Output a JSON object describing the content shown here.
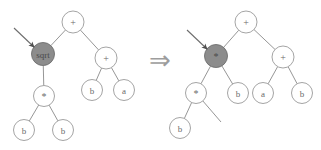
{
  "figure": {
    "implies_symbol": "⇒",
    "colors": {
      "edge": "#8a8a8a",
      "node_stroke": "#9a9a9a",
      "node_fill": "#ffffff",
      "highlight_fill": "#8c8c8c",
      "label": "#6b6b6b",
      "arrow": "#4f4f4f",
      "background": "#ffffff"
    }
  },
  "left_tree": {
    "name": "before-tree",
    "nodes": [
      {
        "id": "L0",
        "label": "+",
        "x": 73,
        "y": 22,
        "r": 11,
        "highlight": false,
        "kind": "operator"
      },
      {
        "id": "L1",
        "label": "sqrt",
        "x": 43,
        "y": 54,
        "r": 11.5,
        "highlight": true,
        "kind": "function"
      },
      {
        "id": "L2",
        "label": "+",
        "x": 106,
        "y": 58,
        "r": 11,
        "highlight": false,
        "kind": "operator"
      },
      {
        "id": "L3",
        "label": "*",
        "x": 44,
        "y": 96,
        "r": 10.5,
        "highlight": false,
        "kind": "operator"
      },
      {
        "id": "L4",
        "label": "b",
        "x": 92,
        "y": 90,
        "r": 10.5,
        "highlight": false,
        "kind": "terminal"
      },
      {
        "id": "L5",
        "label": "a",
        "x": 124,
        "y": 90,
        "r": 10.5,
        "highlight": false,
        "kind": "terminal"
      },
      {
        "id": "L6",
        "label": "b",
        "x": 24,
        "y": 130,
        "r": 10.5,
        "highlight": false,
        "kind": "terminal"
      },
      {
        "id": "L7",
        "label": "b",
        "x": 63,
        "y": 130,
        "r": 10.5,
        "highlight": false,
        "kind": "terminal"
      }
    ],
    "edges": [
      {
        "from": "L0",
        "to": "L1"
      },
      {
        "from": "L0",
        "to": "L2"
      },
      {
        "from": "L1",
        "to": "L3"
      },
      {
        "from": "L2",
        "to": "L4"
      },
      {
        "from": "L2",
        "to": "L5"
      },
      {
        "from": "L3",
        "to": "L6"
      },
      {
        "from": "L3",
        "to": "L7"
      }
    ],
    "pointer": {
      "x1": 14,
      "y1": 28,
      "x2": 34,
      "y2": 47,
      "target": "L1"
    }
  },
  "right_tree": {
    "name": "after-tree",
    "nodes": [
      {
        "id": "R0",
        "label": "+",
        "x": 246,
        "y": 22,
        "r": 11,
        "highlight": false,
        "kind": "operator"
      },
      {
        "id": "R1",
        "label": "*",
        "x": 216,
        "y": 56,
        "r": 11.5,
        "highlight": true,
        "kind": "operator"
      },
      {
        "id": "R2",
        "label": "+",
        "x": 283,
        "y": 57,
        "r": 11,
        "highlight": false,
        "kind": "operator"
      },
      {
        "id": "R3",
        "label": "*",
        "x": 196,
        "y": 93,
        "r": 10.5,
        "highlight": false,
        "kind": "operator"
      },
      {
        "id": "R4",
        "label": "b",
        "x": 238,
        "y": 93,
        "r": 10.5,
        "highlight": false,
        "kind": "terminal"
      },
      {
        "id": "R5",
        "label": "a",
        "x": 263,
        "y": 93,
        "r": 10.5,
        "highlight": false,
        "kind": "terminal"
      },
      {
        "id": "R6",
        "label": "b",
        "x": 302,
        "y": 93,
        "r": 10.5,
        "highlight": false,
        "kind": "terminal"
      },
      {
        "id": "R7",
        "label": "b",
        "x": 180,
        "y": 128,
        "r": 10.5,
        "highlight": false,
        "kind": "terminal"
      }
    ],
    "edges": [
      {
        "from": "R0",
        "to": "R1"
      },
      {
        "from": "R0",
        "to": "R2"
      },
      {
        "from": "R1",
        "to": "R3"
      },
      {
        "from": "R1",
        "to": "R4"
      },
      {
        "from": "R2",
        "to": "R5"
      },
      {
        "from": "R2",
        "to": "R6"
      },
      {
        "from": "R3",
        "to": "R7"
      }
    ],
    "dangling_edges": [
      {
        "from": "R3",
        "x2": 221,
        "y2": 122
      }
    ],
    "pointer": {
      "x1": 187,
      "y1": 30,
      "x2": 207,
      "y2": 49,
      "target": "R1"
    }
  },
  "implies": {
    "x": 160,
    "y": 60,
    "symbol": "⇒"
  }
}
